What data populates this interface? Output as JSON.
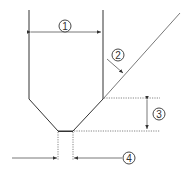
{
  "diagram": {
    "labels": {
      "one": "1",
      "two": "2",
      "three": "3",
      "four": "4"
    },
    "colors": {
      "line": "#333333",
      "background": "#ffffff"
    }
  }
}
